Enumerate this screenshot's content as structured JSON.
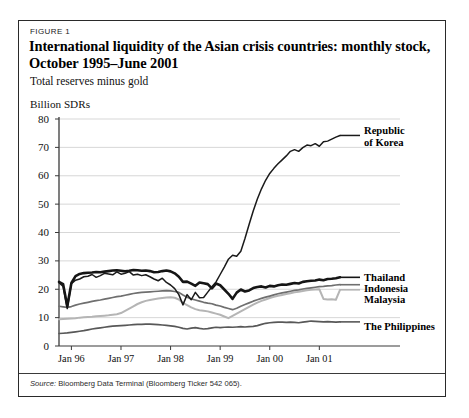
{
  "figure": {
    "label": "FIGURE 1",
    "title": "International liquidity of the Asian crisis countries: monthly stock, October 1995–June 2001",
    "subtitle": "Total reserves minus gold",
    "source_prefix": "Source:",
    "source_text": " Bloomberg Data Terminal (Bloomberg Ticker 542 065)."
  },
  "colors": {
    "korea": "#1a1a1a",
    "thailand": "#151515",
    "indonesia": "#6f6f6f",
    "malaysia": "#b5b5b5",
    "philippines": "#585858",
    "grid": "#d2d2d2",
    "axis": "#3a3a3a",
    "frame": "#2a2a2a"
  },
  "chart_data": {
    "type": "line",
    "title": "International liquidity of the Asian crisis countries: monthly stock, October 1995–June 2001",
    "subtitle": "Total reserves minus gold",
    "xlabel": "",
    "ylabel": "Billion SDRs",
    "ylim": [
      0,
      80
    ],
    "yticks": [
      0,
      10,
      20,
      30,
      40,
      50,
      60,
      70,
      80
    ],
    "ytick_labels": [
      "0",
      "10",
      "20",
      "30",
      "40",
      "50",
      "60",
      "70",
      "80"
    ],
    "grid": true,
    "legend_position": "right-inline",
    "x_start": "Oct 1995",
    "x_end": "Jun 2001",
    "xticks": [
      3,
      15,
      27,
      39,
      51,
      63
    ],
    "xtick_labels": [
      "Jan 96",
      "Jan 97",
      "Jan 98",
      "Jan 99",
      "Jan 00",
      "Jan 01"
    ],
    "n_points": 69,
    "series": [
      {
        "name": "Republic of Korea",
        "label": "Republic\nof Korea",
        "color": "#1a1a1a",
        "width": 1.5,
        "values": [
          22.3,
          21.0,
          13.2,
          22.0,
          23.2,
          23.6,
          24.4,
          24.6,
          25.2,
          24.2,
          24.8,
          25.6,
          25.4,
          25.1,
          26.1,
          25.3,
          25.6,
          26.2,
          25.0,
          25.3,
          24.8,
          25.1,
          24.4,
          23.6,
          23.0,
          23.9,
          22.4,
          21.5,
          20.2,
          18.1,
          14.5,
          18.1,
          16.3,
          18.9,
          17.0,
          17.1,
          19.0,
          20.9,
          22.6,
          25.2,
          27.8,
          30.6,
          32.0,
          31.6,
          33.4,
          37.9,
          42.8,
          47.6,
          51.8,
          55.4,
          58.4,
          60.8,
          62.6,
          64.2,
          65.6,
          67.0,
          68.6,
          69.2,
          68.6,
          69.9,
          70.8,
          70.6,
          71.3,
          70.4,
          72.0,
          72.2,
          72.9,
          73.6,
          74.2
        ]
      },
      {
        "name": "Thailand",
        "label": "Thailand",
        "color": "#151515",
        "width": 2.6,
        "values": [
          22.6,
          21.8,
          14.0,
          22.2,
          24.6,
          25.4,
          25.7,
          25.8,
          25.9,
          26.1,
          26.0,
          26.2,
          26.4,
          26.6,
          26.7,
          26.5,
          26.3,
          26.5,
          26.8,
          26.7,
          26.5,
          26.6,
          26.4,
          26.0,
          26.1,
          26.4,
          26.6,
          26.3,
          25.6,
          24.4,
          22.6,
          22.7,
          22.0,
          21.2,
          22.4,
          22.1,
          21.8,
          20.3,
          22.0,
          21.4,
          19.9,
          18.4,
          16.6,
          18.8,
          19.9,
          19.2,
          19.6,
          20.4,
          20.8,
          21.0,
          20.6,
          21.2,
          21.0,
          21.4,
          21.7,
          21.6,
          21.9,
          22.2,
          22.0,
          22.6,
          22.8,
          23.0,
          23.1,
          23.4,
          23.2,
          23.6,
          23.7,
          23.9,
          24.2
        ]
      },
      {
        "name": "Indonesia",
        "label": "Indonesia",
        "color": "#6f6f6f",
        "width": 1.7,
        "values": [
          14.0,
          13.8,
          13.6,
          13.9,
          14.4,
          14.8,
          15.1,
          15.4,
          15.7,
          16.0,
          16.2,
          16.5,
          16.8,
          17.1,
          17.4,
          17.6,
          17.9,
          18.2,
          18.5,
          18.7,
          18.9,
          19.0,
          19.1,
          19.2,
          19.3,
          19.4,
          19.5,
          19.4,
          19.2,
          18.9,
          18.0,
          17.2,
          16.6,
          16.2,
          15.8,
          15.4,
          15.1,
          14.9,
          14.4,
          14.1,
          13.6,
          13.2,
          12.8,
          13.3,
          14.0,
          14.6,
          15.2,
          15.8,
          16.3,
          16.8,
          17.2,
          17.6,
          18.0,
          18.4,
          18.7,
          19.0,
          19.3,
          19.6,
          19.8,
          20.1,
          20.3,
          20.5,
          20.7,
          20.9,
          21.0,
          21.2,
          21.3,
          21.5,
          21.6
        ]
      },
      {
        "name": "Malaysia",
        "label": "Malaysia",
        "color": "#b5b5b5",
        "width": 2.0,
        "values": [
          9.4,
          9.5,
          9.6,
          9.7,
          9.8,
          10.0,
          10.1,
          10.2,
          10.3,
          10.5,
          10.6,
          10.7,
          10.8,
          11.0,
          11.2,
          11.6,
          12.4,
          13.2,
          14.0,
          14.8,
          15.4,
          15.9,
          16.2,
          16.5,
          16.7,
          16.9,
          17.1,
          17.2,
          17.0,
          16.4,
          15.2,
          14.4,
          13.6,
          13.0,
          12.6,
          12.4,
          12.2,
          11.8,
          11.4,
          11.0,
          10.4,
          9.8,
          10.6,
          11.4,
          12.2,
          13.0,
          13.8,
          14.6,
          15.3,
          15.9,
          16.4,
          16.9,
          17.3,
          17.7,
          18.0,
          18.3,
          18.6,
          18.9,
          19.1,
          19.4,
          19.6,
          19.8,
          19.9,
          20.0,
          16.6,
          16.4,
          16.5,
          16.3,
          19.8
        ]
      },
      {
        "name": "The Philippines",
        "label": "The Philippines",
        "color": "#585858",
        "width": 1.7,
        "values": [
          4.4,
          4.5,
          4.6,
          4.8,
          5.0,
          5.2,
          5.4,
          5.7,
          6.0,
          6.2,
          6.4,
          6.6,
          6.8,
          7.0,
          7.1,
          7.2,
          7.3,
          7.4,
          7.5,
          7.6,
          7.6,
          7.7,
          7.7,
          7.6,
          7.5,
          7.4,
          7.3,
          7.1,
          6.9,
          6.6,
          6.2,
          6.0,
          6.3,
          6.5,
          6.2,
          6.0,
          6.1,
          6.4,
          6.6,
          6.5,
          6.6,
          6.7,
          6.6,
          6.7,
          6.8,
          6.7,
          6.8,
          6.9,
          7.2,
          7.6,
          8.0,
          8.2,
          8.3,
          8.4,
          8.4,
          8.3,
          8.4,
          8.3,
          8.2,
          8.4,
          8.6,
          8.8,
          8.7,
          8.6,
          8.5,
          8.6,
          8.5,
          8.4,
          8.5
        ]
      }
    ]
  },
  "series_labels": [
    {
      "id": "korea",
      "line1": "Republic",
      "line2": "of Korea"
    },
    {
      "id": "thailand",
      "line1": "Thailand",
      "line2": ""
    },
    {
      "id": "indonesia",
      "line1": "Indonesia",
      "line2": ""
    },
    {
      "id": "malaysia",
      "line1": "Malaysia",
      "line2": ""
    },
    {
      "id": "philippines",
      "line1": "The Philippines",
      "line2": ""
    }
  ]
}
